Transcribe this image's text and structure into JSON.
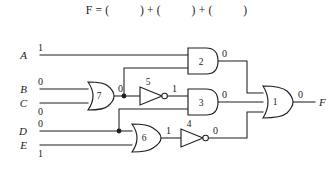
{
  "equation": {
    "lhs": "F",
    "eq": "=",
    "term1": "(          )",
    "plus1": "+",
    "term2": "(          )",
    "plus2": "+",
    "term3": "(          )",
    "full_text": "F = (          ) + (          ) + (          )"
  },
  "circuit": {
    "title": "logic-circuit-diagram",
    "inputs": [
      {
        "name": "A",
        "value": "1"
      },
      {
        "name": "B",
        "value": "0"
      },
      {
        "name": "C",
        "value": "0"
      },
      {
        "name": "D",
        "value": "0"
      },
      {
        "name": "E",
        "value": "1"
      }
    ],
    "output": {
      "name": "F",
      "value": "0"
    },
    "gates": [
      {
        "id": "1",
        "type": "or",
        "label": "1",
        "output_value": "0"
      },
      {
        "id": "2",
        "type": "and",
        "label": "2",
        "output_value": "0"
      },
      {
        "id": "3",
        "type": "and",
        "label": "3",
        "output_value": "0"
      },
      {
        "id": "4",
        "type": "inverter",
        "label": "4",
        "output_value": "0"
      },
      {
        "id": "5",
        "type": "inverter",
        "label": "5",
        "output_value": "1"
      },
      {
        "id": "6",
        "type": "or",
        "label": "6",
        "output_value": "1"
      },
      {
        "id": "7",
        "type": "or",
        "label": "7",
        "output_value": "0"
      }
    ],
    "colors": {
      "wire": "#1f1f1f",
      "text": "#1a1a1a",
      "background": "#ffffff"
    }
  }
}
